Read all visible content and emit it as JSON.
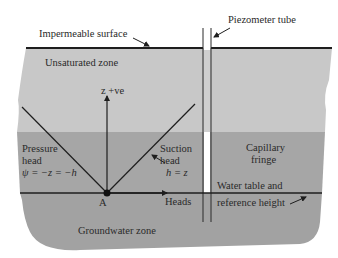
{
  "figure": {
    "colors": {
      "background": "#ffffff",
      "unsaturated_zone": "#c8c8c8",
      "capillary_fringe": "#a6a6a6",
      "groundwater_zone": "#a2a2a2",
      "lines": "#1e1e1e",
      "tube_interior": "#ffffff"
    },
    "labels": {
      "impermeable_surface": "Impermeable surface",
      "piezometer_tube": "Piezometer tube",
      "unsaturated_zone": "Unsaturated zone",
      "z_axis": "z +ve",
      "pressure_head_line1": "Pressure",
      "pressure_head_line2": "head",
      "pressure_head_eq": "ψ = −z = −h",
      "suction_head_line1": "Suction",
      "suction_head_line2": "head",
      "suction_head_eq": "h = z",
      "capillary_fringe_line1": "Capillary",
      "capillary_fringe_line2": "fringe",
      "water_table_line1": "Water table and",
      "water_table_line2": "reference height",
      "point_a": "A",
      "heads_axis": "Heads",
      "groundwater_zone": "Groundwater zone"
    }
  }
}
